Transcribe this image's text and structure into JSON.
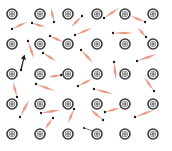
{
  "colors": {
    "background": "#ffffff",
    "ion_ring": "#3a3a3a",
    "ion_fill": "#ffffff",
    "ion_symbol": "#3a3a3a",
    "electron_dot": "#1a1a1a",
    "electron_trail": "#e8907a",
    "highlight_arrow": "#1a1a1a"
  },
  "ion_symbol": "⊕",
  "lattice": {
    "columns_x": [
      12,
      40,
      68,
      97,
      125,
      153
    ],
    "rows_y": [
      14,
      44,
      74,
      104,
      134
    ],
    "ion_radius": 5
  },
  "electrons": [
    {
      "dot": [
        12,
        29
      ],
      "tail": [
        27,
        22
      ]
    },
    {
      "dot": [
        32,
        23
      ],
      "tail": [
        45,
        27
      ]
    },
    {
      "dot": [
        54,
        22
      ],
      "tail": [
        51,
        8
      ]
    },
    {
      "dot": [
        82,
        16
      ],
      "tail": [
        71,
        27
      ]
    },
    {
      "dot": [
        104,
        18
      ],
      "tail": [
        119,
        8
      ]
    },
    {
      "dot": [
        145,
        22
      ],
      "tail": [
        131,
        16
      ]
    },
    {
      "dot": [
        50,
        36
      ],
      "tail": [
        63,
        42
      ]
    },
    {
      "dot": [
        75,
        35
      ],
      "tail": [
        92,
        28
      ]
    },
    {
      "dot": [
        113,
        33
      ],
      "tail": [
        133,
        33
      ]
    },
    {
      "dot": [
        146,
        37
      ],
      "tail": [
        138,
        28
      ]
    },
    {
      "dot": [
        28,
        41
      ],
      "tail": [
        34,
        59
      ]
    },
    {
      "dot": [
        43,
        53
      ],
      "tail": [
        56,
        61
      ]
    },
    {
      "dot": [
        81,
        50
      ],
      "tail": [
        93,
        63
      ]
    },
    {
      "dot": [
        137,
        61
      ],
      "tail": [
        157,
        54
      ]
    },
    {
      "dot": [
        61,
        75
      ],
      "tail": [
        49,
        77
      ]
    },
    {
      "dot": [
        78,
        86
      ],
      "tail": [
        92,
        79
      ]
    },
    {
      "dot": [
        114,
        62
      ],
      "tail": [
        116,
        80
      ]
    },
    {
      "dot": [
        36,
        84
      ],
      "tail": [
        55,
        91
      ]
    },
    {
      "dot": [
        154,
        91
      ],
      "tail": [
        144,
        77
      ]
    },
    {
      "dot": [
        17,
        97
      ],
      "tail": [
        13,
        82
      ]
    },
    {
      "dot": [
        94,
        89
      ],
      "tail": [
        113,
        94
      ]
    },
    {
      "dot": [
        20,
        117
      ],
      "tail": [
        29,
        100
      ]
    },
    {
      "dot": [
        41,
        113
      ],
      "tail": [
        60,
        110
      ]
    },
    {
      "dot": [
        53,
        118
      ],
      "tail": [
        45,
        129
      ]
    },
    {
      "dot": [
        74,
        109
      ],
      "tail": [
        68,
        123
      ]
    },
    {
      "dot": [
        103,
        120
      ],
      "tail": [
        90,
        109
      ]
    },
    {
      "dot": [
        105,
        112
      ],
      "tail": [
        120,
        108
      ]
    },
    {
      "dot": [
        135,
        117
      ],
      "tail": [
        154,
        110
      ]
    }
  ],
  "dark_segments": [
    {
      "from": [
        84,
        128
      ],
      "to": [
        96,
        132
      ]
    }
  ],
  "highlight_arrow": {
    "from": [
      21,
      70
    ],
    "to": [
      24,
      57
    ]
  }
}
